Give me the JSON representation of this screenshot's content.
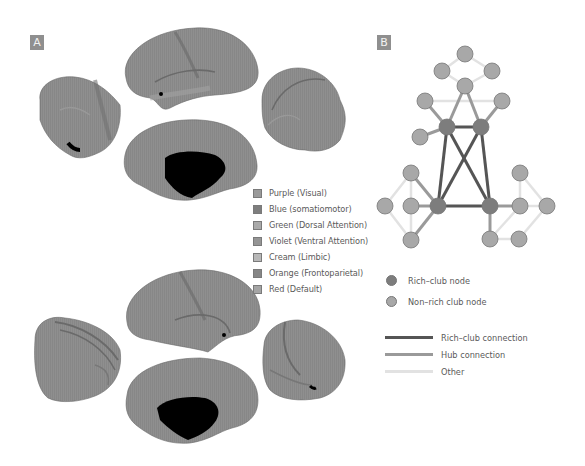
{
  "panels": {
    "a": {
      "label": "A"
    },
    "b": {
      "label": "B"
    }
  },
  "networks_legend": {
    "items": [
      {
        "label": "Purple (Visual)",
        "color": "#9a9a9a"
      },
      {
        "label": "Blue (somatiomotor)",
        "color": "#7e7e7e"
      },
      {
        "label": "Green (Dorsal Attention)",
        "color": "#a9a9a9"
      },
      {
        "label": "Violet (Ventral Attention)",
        "color": "#959595"
      },
      {
        "label": "Cream (Limbic)",
        "color": "#b8b8b8"
      },
      {
        "label": "Orange (Frontoparietal)",
        "color": "#868686"
      },
      {
        "label": "Red (Default)",
        "color": "#a4a4a4"
      }
    ]
  },
  "network_legend": {
    "nodes": [
      {
        "label": "Rich–club node",
        "color": "#7d7d7d"
      },
      {
        "label": "Non–rich club node",
        "color": "#a8a8a8"
      }
    ],
    "edges": [
      {
        "label": "Rich–club connection",
        "color": "#555555"
      },
      {
        "label": "Hub connection",
        "color": "#9a9a9a"
      },
      {
        "label": "Other",
        "color": "#e2e2e2"
      }
    ]
  },
  "colors": {
    "brain_fill": "#8c8c8c",
    "brain_light": "#a3a3a3",
    "brain_dark": "#6a6a6a",
    "medial_wall": "#000000",
    "rich_node": "#7d7d7d",
    "other_node": "#a8a8a8",
    "rich_edge": "#555555",
    "hub_edge": "#9a9a9a",
    "other_edge": "#e2e2e2"
  },
  "chart_data": {
    "type": "network",
    "nodes": [
      {
        "id": "t1",
        "x": 465,
        "y": 54,
        "type": "non-rich"
      },
      {
        "id": "t2",
        "x": 442,
        "y": 71,
        "type": "non-rich"
      },
      {
        "id": "t3",
        "x": 492,
        "y": 71,
        "type": "non-rich"
      },
      {
        "id": "t4",
        "x": 465,
        "y": 86,
        "type": "non-rich"
      },
      {
        "id": "u1",
        "x": 425,
        "y": 101,
        "type": "non-rich"
      },
      {
        "id": "u2",
        "x": 502,
        "y": 101,
        "type": "non-rich"
      },
      {
        "id": "R1",
        "x": 447,
        "y": 127,
        "type": "rich"
      },
      {
        "id": "R2",
        "x": 481,
        "y": 127,
        "type": "rich"
      },
      {
        "id": "u3",
        "x": 420,
        "y": 137,
        "type": "non-rich"
      },
      {
        "id": "l1",
        "x": 411,
        "y": 173,
        "type": "non-rich"
      },
      {
        "id": "l2",
        "x": 385,
        "y": 206,
        "type": "non-rich"
      },
      {
        "id": "l3",
        "x": 411,
        "y": 206,
        "type": "non-rich"
      },
      {
        "id": "R3",
        "x": 438,
        "y": 206,
        "type": "rich"
      },
      {
        "id": "l4",
        "x": 411,
        "y": 240,
        "type": "non-rich"
      },
      {
        "id": "r1",
        "x": 520,
        "y": 173,
        "type": "non-rich"
      },
      {
        "id": "R4",
        "x": 490,
        "y": 206,
        "type": "rich"
      },
      {
        "id": "r2",
        "x": 520,
        "y": 206,
        "type": "non-rich"
      },
      {
        "id": "r3",
        "x": 547,
        "y": 206,
        "type": "non-rich"
      },
      {
        "id": "r4",
        "x": 490,
        "y": 239,
        "type": "non-rich"
      },
      {
        "id": "r5",
        "x": 519,
        "y": 239,
        "type": "non-rich"
      }
    ],
    "edges": [
      {
        "s": "t1",
        "t": "t2",
        "type": "other"
      },
      {
        "s": "t1",
        "t": "t3",
        "type": "other"
      },
      {
        "s": "t2",
        "t": "t4",
        "type": "other"
      },
      {
        "s": "t3",
        "t": "t4",
        "type": "other"
      },
      {
        "s": "u1",
        "t": "u2",
        "type": "other"
      },
      {
        "s": "l1",
        "t": "l2",
        "type": "other"
      },
      {
        "s": "l2",
        "t": "l4",
        "type": "other"
      },
      {
        "s": "l1",
        "t": "l3",
        "type": "other"
      },
      {
        "s": "l3",
        "t": "l4",
        "type": "other"
      },
      {
        "s": "r1",
        "t": "r3",
        "type": "other"
      },
      {
        "s": "r1",
        "t": "r2",
        "type": "other"
      },
      {
        "s": "r2",
        "t": "r3",
        "type": "other"
      },
      {
        "s": "r2",
        "t": "r4",
        "type": "other"
      },
      {
        "s": "r4",
        "t": "r5",
        "type": "other"
      },
      {
        "s": "r5",
        "t": "r3",
        "type": "other"
      },
      {
        "s": "R1",
        "t": "t4",
        "type": "hub"
      },
      {
        "s": "R2",
        "t": "t4",
        "type": "hub"
      },
      {
        "s": "R1",
        "t": "u1",
        "type": "hub"
      },
      {
        "s": "R2",
        "t": "u2",
        "type": "hub"
      },
      {
        "s": "R1",
        "t": "u3",
        "type": "hub"
      },
      {
        "s": "R3",
        "t": "l1",
        "type": "hub"
      },
      {
        "s": "R3",
        "t": "l3",
        "type": "hub"
      },
      {
        "s": "R3",
        "t": "l4",
        "type": "hub"
      },
      {
        "s": "R4",
        "t": "r2",
        "type": "hub"
      },
      {
        "s": "R4",
        "t": "r4",
        "type": "hub"
      },
      {
        "s": "R1",
        "t": "R2",
        "type": "rich"
      },
      {
        "s": "R1",
        "t": "R3",
        "type": "rich"
      },
      {
        "s": "R1",
        "t": "R4",
        "type": "rich"
      },
      {
        "s": "R2",
        "t": "R3",
        "type": "rich"
      },
      {
        "s": "R2",
        "t": "R4",
        "type": "rich"
      },
      {
        "s": "R3",
        "t": "R4",
        "type": "rich"
      }
    ]
  }
}
